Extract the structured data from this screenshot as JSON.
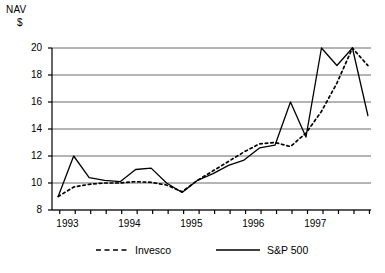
{
  "chart_data": {
    "type": "line",
    "title": "",
    "ylabel": "NAV $",
    "ylabel_line1": "NAV",
    "ylabel_line2": "$",
    "xlabel": "",
    "ylim": [
      8,
      20
    ],
    "yticks": [
      8,
      10,
      12,
      14,
      16,
      18,
      20
    ],
    "ytick_labels": [
      "8",
      "10",
      "12",
      "14",
      "16",
      "18",
      "20"
    ],
    "xlim": [
      1992.75,
      1997.9
    ],
    "xtick_labels": [
      "1993",
      "1994",
      "1995",
      "1996",
      "1997"
    ],
    "xtick_values": [
      1993,
      1994,
      1995,
      1996,
      1997
    ],
    "minor_ticks_per_year": 4,
    "grid": "horizontal",
    "legend_position": "below",
    "series": [
      {
        "name": "Invesco",
        "style": "dashed",
        "color": "#000000",
        "x": [
          1992.85,
          1993.1,
          1993.35,
          1993.6,
          1993.85,
          1994.1,
          1994.35,
          1994.6,
          1994.85,
          1995.1,
          1995.35,
          1995.6,
          1995.85,
          1996.1,
          1996.35,
          1996.6,
          1996.85,
          1997.1,
          1997.35,
          1997.6,
          1997.85
        ],
        "values": [
          9.0,
          9.7,
          9.9,
          10.0,
          10.0,
          10.1,
          10.05,
          9.85,
          9.35,
          10.2,
          10.9,
          11.6,
          12.3,
          12.9,
          13.0,
          12.7,
          13.7,
          15.3,
          17.4,
          20.0,
          18.7
        ]
      },
      {
        "name": "S&P 500",
        "style": "solid",
        "color": "#000000",
        "x": [
          1992.85,
          1993.1,
          1993.35,
          1993.6,
          1993.85,
          1994.1,
          1994.35,
          1994.6,
          1994.85,
          1995.1,
          1995.35,
          1995.6,
          1995.85,
          1996.1,
          1996.35,
          1996.6,
          1996.85,
          1997.1,
          1997.35,
          1997.6,
          1997.85
        ],
        "values": [
          9.0,
          12.0,
          10.4,
          10.2,
          10.1,
          11.0,
          11.1,
          10.0,
          9.3,
          10.2,
          10.7,
          11.3,
          11.7,
          12.6,
          12.8,
          16.0,
          13.4,
          20.0,
          18.7,
          20.0,
          15.0
        ]
      }
    ],
    "legend": [
      {
        "label": "Invesco",
        "style": "dashed"
      },
      {
        "label": "S&P 500",
        "style": "solid"
      }
    ]
  }
}
